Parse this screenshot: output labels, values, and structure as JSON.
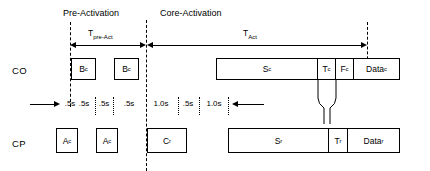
{
  "diagram": {
    "title_phases": [
      {
        "id": "pre-activation",
        "label": "Pre-Activation"
      },
      {
        "id": "core-activation",
        "label": "Core-Activation"
      }
    ],
    "duration_arrows": [
      {
        "id": "t-pre-act",
        "label": "T",
        "sub": "pre-Act"
      },
      {
        "id": "t-act",
        "label": "T",
        "sub": "Act"
      }
    ],
    "rows": [
      {
        "id": "co",
        "label": "CO"
      },
      {
        "id": "cp",
        "label": "CP"
      }
    ],
    "co_blocks": [
      {
        "id": "bc-1",
        "label": "B",
        "sub": "c"
      },
      {
        "id": "bc-2",
        "label": "B",
        "sub": "c"
      },
      {
        "id": "sc",
        "label": "S",
        "sub": "c"
      },
      {
        "id": "tc",
        "label": "T",
        "sub": "c"
      },
      {
        "id": "fc",
        "label": "F",
        "sub": "c"
      },
      {
        "id": "datac",
        "label": "Data",
        "sub": "c"
      }
    ],
    "cp_blocks": [
      {
        "id": "ac-1",
        "label": "A",
        "sub": "c"
      },
      {
        "id": "ac-2",
        "label": "A",
        "sub": "c"
      },
      {
        "id": "cr",
        "label": "C",
        "sub": "r"
      },
      {
        "id": "sr",
        "label": "S",
        "sub": "r"
      },
      {
        "id": "tr",
        "label": "T",
        "sub": "r"
      },
      {
        "id": "datar",
        "label": "Data",
        "sub": "r"
      }
    ],
    "timeline_ticks": [
      {
        "id": "tick-1",
        "label": ".5s"
      },
      {
        "id": "tick-2",
        "label": ".5s"
      },
      {
        "id": "tick-3",
        "label": ".5s"
      },
      {
        "id": "tick-4",
        "label": ".5s"
      },
      {
        "id": "tick-5",
        "label": "1.0s"
      },
      {
        "id": "tick-6",
        "label": ".5s"
      },
      {
        "id": "tick-7",
        "label": "1.0s"
      }
    ],
    "colors": {
      "stroke": "#000000",
      "background": "#ffffff"
    }
  }
}
